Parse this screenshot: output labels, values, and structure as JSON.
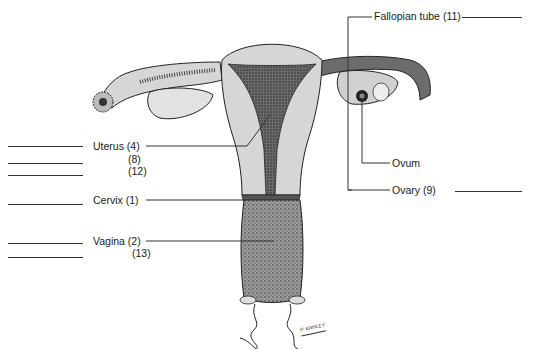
{
  "diagram": {
    "colors": {
      "tissue_light": "#d6d6d6",
      "tissue_dark": "#5a5a5a",
      "outline": "#222222",
      "leader_line": "#333333"
    },
    "labels": [
      {
        "id": "fallopian_tube",
        "text": "Fallopian tube (11)"
      },
      {
        "id": "uterus",
        "text": "Uterus (4)"
      },
      {
        "id": "uterus_8",
        "text": "(8)"
      },
      {
        "id": "uterus_12",
        "text": "(12)"
      },
      {
        "id": "cervix",
        "text": "Cervix (1)"
      },
      {
        "id": "vagina",
        "text": "Vagina (2)"
      },
      {
        "id": "vagina_13",
        "text": "(13)"
      },
      {
        "id": "ovum",
        "text": "Ovum"
      },
      {
        "id": "ovary",
        "text": "Ovary (9)"
      }
    ],
    "signature": "P. KAHLEY",
    "answer_blanks": {
      "left": 6,
      "right": 2
    }
  }
}
